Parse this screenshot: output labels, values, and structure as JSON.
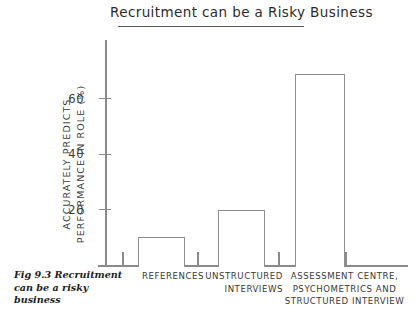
{
  "figure": {
    "title": "Recruitment can be a Risky Business",
    "caption_line1": "Fig 9.3 Recruitment",
    "caption_line2": "can be a risky business"
  },
  "axes": {
    "y_title_line1": "ACCURATELY PREDICTS",
    "y_title_line2": "PERFORMANCE IN ROLE (%)",
    "y_ticks": [
      "20",
      "40",
      "60"
    ],
    "x_labels": [
      {
        "l1": "REFERENCES",
        "l2": "",
        "l3": ""
      },
      {
        "l1": "UNSTRUCTURED",
        "l2": "INTERVIEWS",
        "l3": ""
      },
      {
        "l1": "ASSESSMENT CENTRE,",
        "l2": "PSYCHOMETRICS AND",
        "l3": "STRUCTURED INTERVIEW"
      }
    ]
  },
  "colors": {
    "ink": "#2b2b2b",
    "axis": "#8a8a8a",
    "bar_stroke": "#8f8f8f",
    "bar_fill": "#ffffff",
    "background": "#ffffff"
  },
  "chart_data": {
    "type": "bar",
    "title": "Recruitment can be a Risky Business",
    "xlabel": "",
    "ylabel": "ACCURATELY PREDICTS PERFORMANCE IN ROLE (%)",
    "categories": [
      "REFERENCES",
      "UNSTRUCTURED INTERVIEWS",
      "ASSESSMENT CENTRE, PSYCHOMETRICS AND STRUCTURED INTERVIEW"
    ],
    "values": [
      10,
      20,
      69
    ],
    "ylim": [
      0,
      82
    ],
    "yticks": [
      20,
      40,
      60
    ],
    "grid": false,
    "legend": null
  }
}
